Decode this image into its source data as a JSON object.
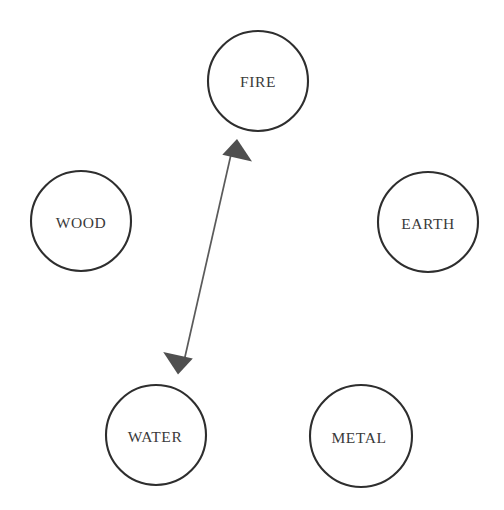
{
  "diagram": {
    "background_color": "#ffffff",
    "node_fill_color": "#ffffff",
    "node_stroke_color": "#2e2e2e",
    "label_color": "#3a3a3a",
    "edge_color": "#5a5a5a",
    "arrowhead_color": "#4f4f4f",
    "nodes": [
      {
        "id": "fire",
        "label": "FIRE",
        "cx": 258,
        "cy": 81,
        "r": 50
      },
      {
        "id": "wood",
        "label": "WOOD",
        "cx": 81,
        "cy": 221,
        "r": 50
      },
      {
        "id": "earth",
        "label": "EARTH",
        "cx": 428,
        "cy": 222,
        "r": 50
      },
      {
        "id": "water",
        "label": "WATER",
        "cx": 156,
        "cy": 435,
        "r": 50
      },
      {
        "id": "metal",
        "label": "METAL",
        "cx": 361,
        "cy": 436,
        "r": 51
      }
    ],
    "edges": [
      {
        "id": "water-fire",
        "from": "water",
        "to": "fire",
        "label": "",
        "direction": "bidirectional",
        "x1": 178,
        "y1": 374,
        "x2": 237,
        "y2": 139
      }
    ],
    "page_artifact": {
      "visible": true,
      "text": "cut off scanned caption line"
    }
  }
}
